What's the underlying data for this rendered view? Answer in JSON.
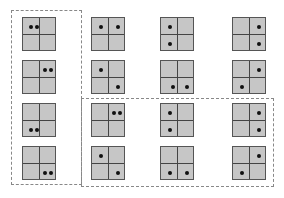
{
  "diagram": {
    "tile_color": "#c6c6c6",
    "grid_line_color": "#444444",
    "dot_color": "#111111",
    "groups": [
      {
        "name": "left-column-group",
        "x": 11,
        "y": 10,
        "w": 71,
        "h": 175
      },
      {
        "name": "bottom-right-group",
        "x": 81,
        "y": 98,
        "w": 193,
        "h": 89
      }
    ],
    "tiles": [
      {
        "x": 22,
        "y": 17,
        "dots": [
          [
            8,
            9
          ],
          [
            14,
            9
          ]
        ]
      },
      {
        "x": 22,
        "y": 60,
        "dots": [
          [
            22,
            9
          ],
          [
            28,
            9
          ]
        ]
      },
      {
        "x": 22,
        "y": 103,
        "dots": [
          [
            8,
            26
          ],
          [
            14,
            26
          ]
        ]
      },
      {
        "x": 22,
        "y": 146,
        "dots": [
          [
            22,
            26
          ],
          [
            28,
            26
          ]
        ]
      },
      {
        "x": 91,
        "y": 17,
        "dots": [
          [
            9,
            9
          ],
          [
            26,
            9
          ]
        ]
      },
      {
        "x": 91,
        "y": 60,
        "dots": [
          [
            9,
            9
          ],
          [
            26,
            26
          ]
        ]
      },
      {
        "x": 91,
        "y": 103,
        "dots": [
          [
            22,
            9
          ],
          [
            28,
            9
          ]
        ]
      },
      {
        "x": 91,
        "y": 146,
        "dots": [
          [
            9,
            9
          ],
          [
            26,
            26
          ]
        ]
      },
      {
        "x": 160,
        "y": 17,
        "dots": [
          [
            9,
            9
          ],
          [
            9,
            26
          ]
        ]
      },
      {
        "x": 160,
        "y": 60,
        "dots": [
          [
            12,
            26
          ],
          [
            26,
            26
          ]
        ]
      },
      {
        "x": 160,
        "y": 103,
        "dots": [
          [
            9,
            9
          ],
          [
            9,
            26
          ]
        ]
      },
      {
        "x": 160,
        "y": 146,
        "dots": [
          [
            9,
            26
          ],
          [
            26,
            26
          ]
        ]
      },
      {
        "x": 232,
        "y": 17,
        "dots": [
          [
            26,
            9
          ],
          [
            26,
            26
          ]
        ]
      },
      {
        "x": 232,
        "y": 60,
        "dots": [
          [
            26,
            9
          ],
          [
            9,
            26
          ]
        ]
      },
      {
        "x": 232,
        "y": 103,
        "dots": [
          [
            26,
            9
          ],
          [
            26,
            26
          ]
        ]
      },
      {
        "x": 232,
        "y": 146,
        "dots": [
          [
            26,
            9
          ],
          [
            9,
            26
          ]
        ]
      }
    ]
  }
}
